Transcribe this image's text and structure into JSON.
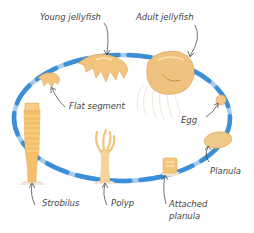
{
  "diagram": {
    "type": "life-cycle",
    "colors": {
      "cycle_ring": "#3a8fd6",
      "cycle_ring_light": "#a9cdee",
      "organism": "#f2c47e",
      "organism_dark": "#e0a24f",
      "label_text": "#444444",
      "pointer": "#333333"
    },
    "stages": [
      {
        "id": "young-jellyfish",
        "label": "Young jellyfish"
      },
      {
        "id": "adult-jellyfish",
        "label": "Adult jellyfish"
      },
      {
        "id": "egg",
        "label": "Egg"
      },
      {
        "id": "planula",
        "label": "Planula"
      },
      {
        "id": "attached-planula",
        "label_line1": "Attached",
        "label_line2": "planula"
      },
      {
        "id": "polyp",
        "label": "Polyp"
      },
      {
        "id": "strobilus",
        "label": "Strobilus"
      },
      {
        "id": "flat-segment",
        "label": "Flat segment"
      }
    ]
  }
}
